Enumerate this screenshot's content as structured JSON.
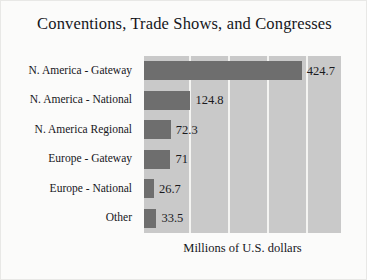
{
  "chart_data": {
    "type": "bar",
    "orientation": "horizontal",
    "title": "Conventions, Trade Shows, and Congresses",
    "xlabel": "Millions of U.S. dollars",
    "ylabel": "",
    "categories": [
      "N. America - Gateway",
      "N. America - National",
      "N. America Regional",
      "Europe - Gateway",
      "Europe - National",
      "Other"
    ],
    "values": [
      424.7,
      124.8,
      72.3,
      71,
      26.7,
      33.5
    ],
    "value_labels": [
      "424.7",
      "124.8",
      "72.3",
      "71",
      "26.7",
      "33.5"
    ],
    "xlim": [
      0,
      530
    ],
    "gridlines": [
      120,
      225,
      330,
      435
    ],
    "grid": true,
    "tick_labels_shown": false,
    "legend": null,
    "colors": {
      "bar": "#6e6e6e",
      "plot_background": "#c9c9c9",
      "figure_background": "#fbfbfa",
      "gridline": "#f4f4f2",
      "text": "#16161a"
    }
  },
  "caption": "Millions of U.S. dollars"
}
